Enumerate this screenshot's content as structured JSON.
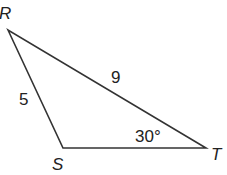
{
  "diagram": {
    "type": "triangle",
    "vertices": {
      "R": {
        "label": "R",
        "x": 8,
        "y": 30
      },
      "S": {
        "label": "S",
        "x": 63,
        "y": 148
      },
      "T": {
        "label": "T",
        "x": 206,
        "y": 148
      }
    },
    "sides": {
      "RS": {
        "label": "5"
      },
      "RT": {
        "label": "9"
      },
      "ST": {
        "label": ""
      }
    },
    "angles": {
      "T": {
        "label": "30°"
      }
    },
    "colors": {
      "stroke": "#333333",
      "text": "#222222"
    }
  }
}
